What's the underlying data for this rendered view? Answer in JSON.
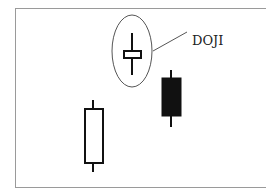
{
  "diagram": {
    "annotation_label": "DOJI",
    "candles": [
      {
        "name": "doji",
        "type": "doji",
        "body_fill": "#ffffff"
      },
      {
        "name": "bullish",
        "type": "hollow",
        "body_fill": "#ffffff"
      },
      {
        "name": "bearish",
        "type": "filled",
        "body_fill": "#111111"
      }
    ],
    "colors": {
      "stroke": "#111111",
      "frame": "#9a9a9a",
      "ellipse": "#555555"
    }
  }
}
